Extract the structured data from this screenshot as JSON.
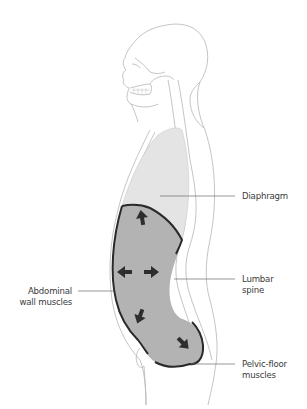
{
  "figure": {
    "colors": {
      "outline": "#b5b5b5",
      "thorax_fill": "#e4e4e4",
      "abdomen_fill": "#b3b3b3",
      "muscle_stroke": "#2a2a2a",
      "arrow": "#2e2e2e",
      "leader_line": "#6a6a6a",
      "label_text": "#3a3a3a"
    },
    "arrows": [
      {
        "name": "arrow-up",
        "direction": "up"
      },
      {
        "name": "arrow-left",
        "direction": "left"
      },
      {
        "name": "arrow-right",
        "direction": "right"
      },
      {
        "name": "arrow-down-left",
        "direction": "down-left"
      },
      {
        "name": "arrow-down-right",
        "direction": "down-right"
      }
    ]
  },
  "labels": {
    "diaphragm": {
      "line1": "Diaphragm"
    },
    "lumbar_spine": {
      "line1": "Lumbar",
      "line2": "spine"
    },
    "abdominal_wall": {
      "line1": "Abdominal",
      "line2": "wall muscles"
    },
    "pelvic_floor": {
      "line1": "Pelvic-floor",
      "line2": "muscles"
    }
  }
}
